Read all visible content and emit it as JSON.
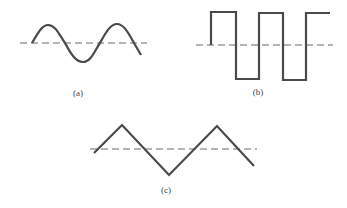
{
  "figures": [
    {
      "id": "a",
      "label": "(a)",
      "shape": "sine",
      "label_pos": [
        78,
        93
      ],
      "baseline": {
        "x1": 20,
        "x2": 147,
        "y": 43
      },
      "path": "M32,43 C38,33 42,25 48,25 C56,25 60,36 65,43 C70,52 75,62 83,62 C91,62 95,50 100,43 C105,34 110,24 117,24 C124,24 129,34 134,43 L141,55"
    },
    {
      "id": "b",
      "label": "(b)",
      "shape": "square",
      "label_pos": [
        258,
        92
      ],
      "baseline": {
        "x1": 196,
        "x2": 333,
        "y": 45
      },
      "path": "M211,45 L211,12 L236,12 L236,79 L259,79 L259,13 L283,13 L283,80 L306,80 L306,13 L330,13"
    },
    {
      "id": "c",
      "label": "(c)",
      "shape": "triangle",
      "label_pos": [
        166,
        190
      ],
      "baseline": {
        "x1": 90,
        "x2": 257,
        "y": 149
      },
      "path": "M94,153 L122,125 L169,175 L217,126 L254,166"
    }
  ],
  "colors": {
    "wave": "#4a4a4a",
    "baseline": "#6a6a6a",
    "background": "#ffffff"
  }
}
